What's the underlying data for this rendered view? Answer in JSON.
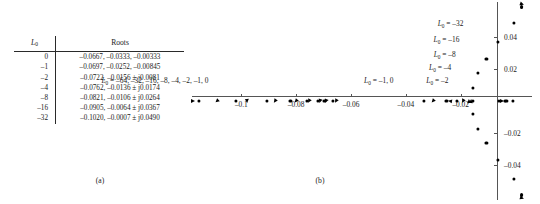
{
  "figure": {
    "panel_a_caption": "(a)",
    "panel_b_caption": "(b)"
  },
  "table": {
    "headers": [
      "L0",
      "Roots"
    ],
    "header_l0_base": "L",
    "header_l0_sub": "0",
    "header_roots": "Roots",
    "rows": [
      {
        "L0": "0",
        "roots": "–0.0667, –0.0333, –0.00333"
      },
      {
        "L0": "–1",
        "roots": "–0.0697, –0.0252, –0.00845"
      },
      {
        "L0": "–2",
        "roots": "–0.0722, –0.0156 ± j0.0081"
      },
      {
        "L0": "–4",
        "roots": "–0.0762, –0.0136 ± j0.0174"
      },
      {
        "L0": "–8",
        "roots": "–0.0821, –0.0106 ± j0.0264"
      },
      {
        "L0": "–16",
        "roots": "–0.0905, –0.0064 ± j0.0367"
      },
      {
        "L0": "–32",
        "roots": "–0.1020, –0.0007 ± j0.0490"
      }
    ]
  },
  "chart_data": {
    "type": "scatter",
    "title": "",
    "xlabel": "",
    "ylabel": "",
    "xlim": [
      -0.118,
      0.006
    ],
    "ylim": [
      -0.062,
      0.062
    ],
    "grid": false,
    "legend": "none",
    "xticks": [
      -0.1,
      -0.08,
      -0.06,
      -0.04,
      -0.02
    ],
    "xticklabels": [
      "–0.1",
      "–0.08",
      "–0.06",
      "–0.04",
      "–0.02"
    ],
    "yticks": [
      0.04,
      0.02,
      -0.02,
      -0.04
    ],
    "yticklabels": [
      "0.04",
      "0.02",
      "–0.02",
      "–0.04"
    ],
    "annotations": [
      {
        "text": "L0 = –64, –32, –16, –8, –4, –2, –1, 0",
        "x": -0.112,
        "y": 0.0125
      },
      {
        "text": "L0 = –1, 0",
        "x": -0.0445,
        "y": 0.0125
      },
      {
        "text": "L0 = –2",
        "x": -0.0245,
        "y": 0.0125
      },
      {
        "text": "L0 = –4",
        "x": -0.0235,
        "y": 0.0205
      },
      {
        "text": "L0 = –8",
        "x": -0.0218,
        "y": 0.029
      },
      {
        "text": "L0 = –16",
        "x": -0.0205,
        "y": 0.0385
      },
      {
        "text": "L0 = –32",
        "x": -0.019,
        "y": 0.048
      }
    ],
    "series": [
      {
        "name": "real-axis-roots-left-branch",
        "points": [
          {
            "x": -0.1155,
            "y": 0
          },
          {
            "x": -0.102,
            "y": 0
          },
          {
            "x": -0.0905,
            "y": 0
          },
          {
            "x": -0.0821,
            "y": 0
          },
          {
            "x": -0.0762,
            "y": 0
          },
          {
            "x": -0.0722,
            "y": 0
          },
          {
            "x": -0.0697,
            "y": 0
          },
          {
            "x": -0.0667,
            "y": 0
          }
        ]
      },
      {
        "name": "real-axis-roots-middle-branch",
        "points": [
          {
            "x": -0.0333,
            "y": 0
          },
          {
            "x": -0.0252,
            "y": 0
          },
          {
            "x": -0.0215,
            "y": 0
          },
          {
            "x": -0.0156,
            "y": 0
          }
        ]
      },
      {
        "name": "real-axis-roots-right-branch",
        "points": [
          {
            "x": -0.006,
            "y": 0
          },
          {
            "x": -0.004,
            "y": 0
          },
          {
            "x": -0.00333,
            "y": 0
          },
          {
            "x": -0.00085,
            "y": 0
          }
        ]
      },
      {
        "name": "complex-conjugate-upper",
        "points": [
          {
            "x": -0.0156,
            "y": 0.0081
          },
          {
            "x": -0.0136,
            "y": 0.0174
          },
          {
            "x": -0.0106,
            "y": 0.0264
          },
          {
            "x": -0.0064,
            "y": 0.0367
          },
          {
            "x": -0.0007,
            "y": 0.049
          },
          {
            "x": 0.0022,
            "y": 0.0588
          }
        ]
      },
      {
        "name": "complex-conjugate-lower",
        "points": [
          {
            "x": -0.0156,
            "y": -0.0081
          },
          {
            "x": -0.0136,
            "y": -0.0174
          },
          {
            "x": -0.0106,
            "y": -0.0264
          },
          {
            "x": -0.0064,
            "y": -0.0367
          },
          {
            "x": -0.0007,
            "y": -0.049
          },
          {
            "x": 0.0022,
            "y": -0.0588
          }
        ]
      }
    ],
    "direction_arrows": [
      {
        "x": -0.1175,
        "y": 0,
        "angle": 180
      },
      {
        "x": -0.109,
        "y": 0,
        "angle": 318
      },
      {
        "x": -0.098,
        "y": 0,
        "angle": 265
      },
      {
        "x": -0.0878,
        "y": 0,
        "angle": 305
      },
      {
        "x": -0.08,
        "y": 0,
        "angle": 312
      },
      {
        "x": -0.0755,
        "y": 0,
        "angle": 300
      },
      {
        "x": -0.0712,
        "y": 0,
        "angle": 288
      },
      {
        "x": -0.069,
        "y": 0,
        "angle": 292
      },
      {
        "x": -0.0655,
        "y": 0,
        "angle": 300
      },
      {
        "x": -0.03,
        "y": 0,
        "angle": 312
      },
      {
        "x": -0.024,
        "y": 0,
        "angle": 10
      },
      {
        "x": -0.019,
        "y": 0,
        "angle": 298
      },
      {
        "x": -0.0168,
        "y": 0,
        "angle": 86
      },
      {
        "x": -0.0162,
        "y": 0,
        "angle": 95
      },
      {
        "x": -0.005,
        "y": 0,
        "angle": 182
      },
      {
        "x": 0.0023,
        "y": 0.0605,
        "angle": 200
      },
      {
        "x": 0.0023,
        "y": -0.0605,
        "angle": 200
      }
    ]
  }
}
